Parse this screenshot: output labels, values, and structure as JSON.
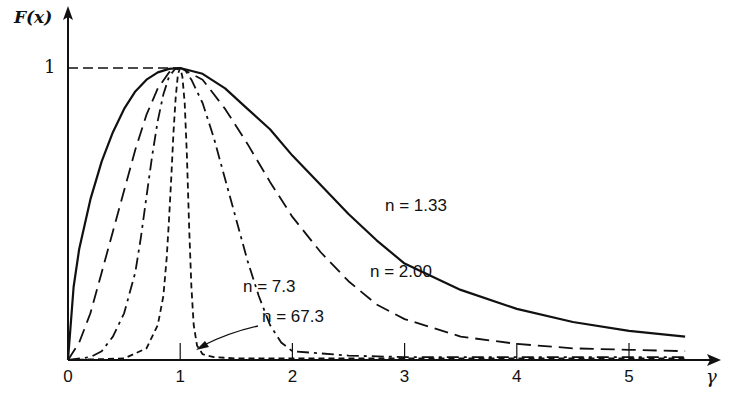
{
  "chart_data": {
    "type": "line",
    "title": "",
    "ylabel": "F(x)",
    "xlabel": "γ",
    "xlim": [
      0,
      5.5
    ],
    "ylim": [
      0,
      1
    ],
    "x_ticks": [
      "0",
      "1",
      "2",
      "3",
      "4",
      "5"
    ],
    "y_ticks": [
      "1"
    ],
    "grid": false,
    "legend": "inline labels",
    "series": [
      {
        "name": "n = 1.33",
        "style": "solid",
        "x": [
          0,
          0.05,
          0.1,
          0.2,
          0.3,
          0.4,
          0.5,
          0.6,
          0.7,
          0.8,
          0.9,
          1.0,
          1.2,
          1.4,
          1.6,
          1.8,
          2.0,
          2.25,
          2.5,
          2.75,
          3.0,
          3.5,
          4.0,
          4.5,
          5.0,
          5.5
        ],
        "y": [
          0,
          0.25,
          0.38,
          0.55,
          0.68,
          0.78,
          0.86,
          0.92,
          0.96,
          0.985,
          0.997,
          1.0,
          0.98,
          0.93,
          0.86,
          0.79,
          0.7,
          0.6,
          0.5,
          0.41,
          0.33,
          0.24,
          0.175,
          0.13,
          0.1,
          0.08
        ]
      },
      {
        "name": "n = 2.00",
        "style": "dashed",
        "x": [
          0,
          0.1,
          0.2,
          0.3,
          0.4,
          0.5,
          0.6,
          0.7,
          0.8,
          0.9,
          1.0,
          1.2,
          1.4,
          1.6,
          1.8,
          2.0,
          2.25,
          2.5,
          2.75,
          3.0,
          3.5,
          4.0,
          4.5,
          5.0,
          5.5
        ],
        "y": [
          0,
          0.06,
          0.16,
          0.3,
          0.44,
          0.58,
          0.72,
          0.84,
          0.93,
          0.985,
          1.0,
          0.96,
          0.86,
          0.74,
          0.61,
          0.49,
          0.37,
          0.27,
          0.19,
          0.14,
          0.08,
          0.055,
          0.04,
          0.035,
          0.03
        ]
      },
      {
        "name": "n = 7.3",
        "style": "dash-dot",
        "x": [
          0,
          0.2,
          0.3,
          0.4,
          0.5,
          0.6,
          0.65,
          0.7,
          0.75,
          0.8,
          0.85,
          0.9,
          0.95,
          1.0,
          1.05,
          1.1,
          1.2,
          1.3,
          1.4,
          1.5,
          1.6,
          1.7,
          1.8,
          1.9,
          2.0,
          2.5,
          3.0,
          4.0,
          5.0,
          5.5
        ],
        "y": [
          0,
          0.01,
          0.03,
          0.08,
          0.16,
          0.3,
          0.42,
          0.56,
          0.7,
          0.82,
          0.91,
          0.97,
          0.995,
          1.0,
          0.99,
          0.96,
          0.88,
          0.76,
          0.62,
          0.48,
          0.34,
          0.22,
          0.12,
          0.06,
          0.03,
          0.015,
          0.01,
          0.01,
          0.01,
          0.01
        ]
      },
      {
        "name": "n = 67.3",
        "style": "short-dashed",
        "x": [
          0,
          0.5,
          0.7,
          0.8,
          0.85,
          0.88,
          0.9,
          0.92,
          0.94,
          0.96,
          0.98,
          1.0,
          1.02,
          1.04,
          1.06,
          1.08,
          1.1,
          1.12,
          1.15,
          1.2,
          1.3,
          1.5,
          2.0,
          3.0,
          4.0,
          5.0,
          5.5
        ],
        "y": [
          0,
          0.005,
          0.04,
          0.12,
          0.22,
          0.35,
          0.48,
          0.62,
          0.78,
          0.9,
          0.98,
          1.0,
          0.97,
          0.88,
          0.7,
          0.45,
          0.25,
          0.12,
          0.05,
          0.02,
          0.01,
          0.005,
          0.005,
          0.005,
          0.005,
          0.005,
          0.005
        ]
      }
    ],
    "annotations": [
      {
        "text": "n = 1.33",
        "near_x": 3.4,
        "near_y": 0.45
      },
      {
        "text": "n = 2.00",
        "near_x": 3.1,
        "near_y": 0.2
      },
      {
        "text": "n = 7.3",
        "near_x": 2.0,
        "near_y": 0.18
      },
      {
        "text": "n = 67.3",
        "near_x": 2.3,
        "near_y": 0.12,
        "arrow_to": [
          1.15,
          0.03
        ]
      }
    ]
  },
  "labels": {
    "ylabel": "F(x)",
    "xlabel": "γ",
    "y_tick_1": "1",
    "x_ticks": [
      "0",
      "1",
      "2",
      "3",
      "4",
      "5"
    ],
    "n133": "n = 1.33",
    "n200": "n = 2.00",
    "n73": "n = 7.3",
    "n673": "n = 67.3"
  }
}
